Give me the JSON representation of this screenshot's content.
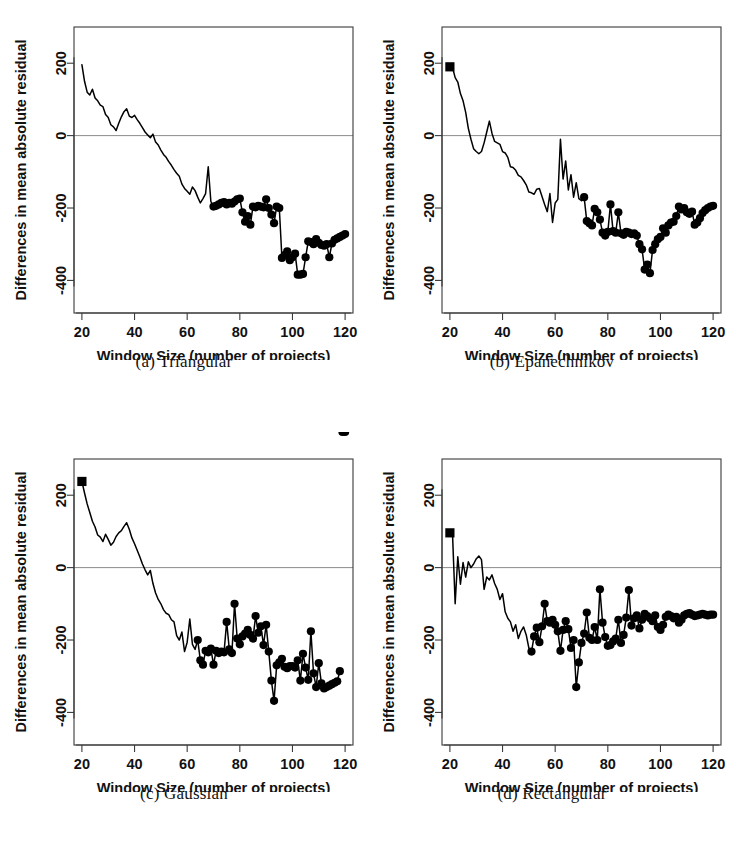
{
  "figure": {
    "type": "multi-panel-line-chart",
    "rows": 2,
    "columns": 2,
    "background": "#ffffff",
    "line_color": "#000000",
    "marker_color": "#000000",
    "zero_line_color": "#8d8d8d",
    "frame_color": "#3a3a3a"
  },
  "common": {
    "xlabel": "Window Size (number of projects)",
    "ylabel": "Differences in mean absolute residual",
    "xticks": [
      "20",
      "40",
      "60",
      "80",
      "100",
      "120"
    ],
    "yticks": [
      "200",
      "0",
      "-200",
      "-400"
    ],
    "xlim": [
      17,
      123
    ],
    "ylim": [
      -490,
      300
    ]
  },
  "chart_data": [
    {
      "id": "panel-a",
      "type": "line",
      "title": "",
      "caption": "(a) Triangular",
      "caption_tag": "(a)",
      "caption_name": "Triangular",
      "xlabel": "Window Size (number of projects)",
      "ylabel": "Differences in mean absolute residual",
      "xticks": [
        20,
        40,
        60,
        80,
        100,
        120
      ],
      "yticks": [
        200,
        0,
        -200,
        -400
      ],
      "xlim": [
        17,
        123
      ],
      "ylim": [
        -490,
        300
      ],
      "grid": false,
      "zero_line": 0,
      "legend": null,
      "start_marker": false,
      "x": [
        20,
        21,
        22,
        23,
        24,
        25,
        26,
        27,
        28,
        29,
        30,
        31,
        32,
        33,
        34,
        35,
        36,
        37,
        38,
        39,
        40,
        41,
        42,
        43,
        44,
        45,
        46,
        47,
        48,
        49,
        50,
        51,
        52,
        53,
        54,
        55,
        56,
        57,
        58,
        59,
        60,
        61,
        62,
        63,
        64,
        65,
        66,
        67,
        68,
        69,
        70,
        71,
        72,
        73,
        74,
        75,
        76,
        77,
        78,
        79,
        80,
        81,
        82,
        83,
        84,
        85,
        86,
        87,
        88,
        89,
        90,
        91,
        92,
        93,
        94,
        95,
        96,
        97,
        98,
        99,
        100,
        101,
        102,
        103,
        104,
        105,
        106,
        107,
        108,
        109,
        110,
        111,
        112,
        113,
        114,
        115,
        116,
        117,
        118,
        119,
        120
      ],
      "y": [
        196,
        150,
        120,
        112,
        128,
        104,
        96,
        84,
        80,
        58,
        50,
        30,
        24,
        14,
        34,
        52,
        66,
        74,
        54,
        50,
        56,
        44,
        34,
        22,
        10,
        2,
        -6,
        4,
        -18,
        -26,
        -40,
        -52,
        -60,
        -72,
        -82,
        -94,
        -104,
        -112,
        -134,
        -146,
        -154,
        -162,
        -142,
        -152,
        -170,
        -186,
        -174,
        -160,
        -86,
        -182,
        -196,
        -194,
        -190,
        -186,
        -184,
        -190,
        -186,
        -188,
        -182,
        -176,
        -174,
        -212,
        -238,
        -222,
        -246,
        -196,
        -198,
        -194,
        -196,
        -198,
        -176,
        -200,
        -218,
        -242,
        -196,
        -200,
        -338,
        -330,
        -320,
        -344,
        -336,
        -326,
        -384,
        -384,
        -382,
        -336,
        -292,
        -294,
        -300,
        -286,
        -296,
        -302,
        -304,
        -300,
        -336,
        -298,
        -288,
        -284,
        -280,
        -276,
        -272
      ],
      "marker_from_x": 70
    },
    {
      "id": "panel-b",
      "type": "line",
      "caption": "(b) Epanechnikov",
      "caption_tag": "(b)",
      "caption_name": "Epanechnikov",
      "xlabel": "Window Size (number of projects)",
      "ylabel": "Differences in mean absolute residual",
      "xticks": [
        20,
        40,
        60,
        80,
        100,
        120
      ],
      "yticks": [
        200,
        0,
        -200,
        -400
      ],
      "xlim": [
        17,
        123
      ],
      "ylim": [
        -490,
        300
      ],
      "grid": false,
      "zero_line": 0,
      "legend": null,
      "start_marker": true,
      "start_marker_shape": "square",
      "x": [
        20,
        21,
        22,
        23,
        24,
        25,
        26,
        27,
        28,
        29,
        30,
        31,
        32,
        33,
        34,
        35,
        36,
        37,
        38,
        39,
        40,
        41,
        42,
        43,
        44,
        45,
        46,
        47,
        48,
        49,
        50,
        51,
        52,
        53,
        54,
        55,
        56,
        57,
        58,
        59,
        60,
        61,
        62,
        63,
        64,
        65,
        66,
        67,
        68,
        69,
        70,
        71,
        72,
        73,
        74,
        75,
        76,
        77,
        78,
        79,
        80,
        81,
        82,
        83,
        84,
        85,
        86,
        87,
        88,
        89,
        90,
        91,
        92,
        93,
        94,
        95,
        96,
        97,
        98,
        99,
        100,
        101,
        102,
        103,
        104,
        105,
        106,
        107,
        108,
        109,
        110,
        111,
        112,
        113,
        114,
        115,
        116,
        117,
        118,
        119,
        120
      ],
      "y": [
        190,
        188,
        160,
        148,
        116,
        96,
        64,
        20,
        -10,
        -36,
        -44,
        -50,
        -44,
        -20,
        10,
        40,
        6,
        -16,
        -20,
        -24,
        -44,
        -48,
        -60,
        -86,
        -88,
        -96,
        -110,
        -114,
        -124,
        -136,
        -156,
        -158,
        -162,
        -148,
        -146,
        -168,
        -190,
        -210,
        -160,
        -240,
        -186,
        -176,
        -10,
        -120,
        -70,
        -150,
        -108,
        -170,
        -130,
        -174,
        -180,
        -170,
        -236,
        -242,
        -248,
        -202,
        -212,
        -232,
        -268,
        -276,
        -266,
        -190,
        -264,
        -268,
        -212,
        -270,
        -274,
        -266,
        -268,
        -272,
        -270,
        -276,
        -300,
        -314,
        -370,
        -356,
        -380,
        -316,
        -300,
        -286,
        -280,
        -256,
        -268,
        -248,
        -240,
        -238,
        -222,
        -196,
        -204,
        -200,
        -212,
        -216,
        -210,
        -246,
        -240,
        -228,
        -214,
        -206,
        -200,
        -196,
        -194,
        -200
      ],
      "marker_from_x": 71
    },
    {
      "id": "panel-c",
      "type": "line",
      "caption": "(c) Gaussian",
      "caption_tag": "(c)",
      "caption_name": "Gaussian",
      "xlabel": "Window Size (number of projects)",
      "ylabel": "Differences in mean absolute residual",
      "xticks": [
        20,
        40,
        60,
        80,
        100,
        120
      ],
      "yticks": [
        200,
        0,
        -200,
        -400
      ],
      "xlim": [
        17,
        123
      ],
      "ylim": [
        -490,
        300
      ],
      "grid": false,
      "zero_line": 0,
      "legend": null,
      "start_marker": true,
      "start_marker_shape": "square",
      "x": [
        20,
        21,
        22,
        23,
        24,
        25,
        26,
        27,
        28,
        29,
        30,
        31,
        32,
        33,
        34,
        35,
        36,
        37,
        38,
        39,
        40,
        41,
        42,
        43,
        44,
        45,
        46,
        47,
        48,
        49,
        50,
        51,
        52,
        53,
        54,
        55,
        56,
        57,
        58,
        59,
        60,
        61,
        62,
        63,
        64,
        65,
        66,
        67,
        68,
        69,
        70,
        71,
        72,
        73,
        74,
        75,
        76,
        77,
        78,
        79,
        80,
        81,
        82,
        83,
        84,
        85,
        86,
        87,
        88,
        89,
        90,
        91,
        92,
        93,
        94,
        95,
        96,
        97,
        98,
        99,
        100,
        101,
        102,
        103,
        104,
        105,
        106,
        107,
        108,
        109,
        110,
        111,
        112,
        113,
        114,
        115,
        116,
        117,
        118,
        119,
        120
      ],
      "y": [
        238,
        206,
        176,
        152,
        128,
        112,
        90,
        84,
        72,
        92,
        78,
        62,
        70,
        86,
        96,
        102,
        114,
        124,
        106,
        82,
        66,
        48,
        30,
        10,
        -6,
        -20,
        -8,
        -44,
        -70,
        -88,
        -100,
        -116,
        -126,
        -130,
        -144,
        -150,
        -188,
        -200,
        -178,
        -232,
        -206,
        -142,
        -212,
        -226,
        -200,
        -256,
        -268,
        -230,
        -234,
        -224,
        -268,
        -230,
        -236,
        -232,
        -234,
        -150,
        -226,
        -236,
        -100,
        -196,
        -212,
        -190,
        -182,
        -172,
        -186,
        -196,
        -134,
        -180,
        -162,
        -214,
        -158,
        -232,
        -312,
        -368,
        -270,
        -262,
        -252,
        -274,
        -278,
        -272,
        -272,
        -276,
        -256,
        -312,
        -238,
        -276,
        -310,
        -176,
        -292,
        -330,
        -264,
        -320,
        -334,
        -330,
        -326,
        -322,
        -318,
        -314,
        -286
      ],
      "marker_from_x": 64
    },
    {
      "id": "panel-d",
      "type": "line",
      "caption": "(d) Rectangular",
      "caption_tag": "(d)",
      "caption_name": "Rectangular",
      "xlabel": "Window Size (number of projects)",
      "ylabel": "Differences in mean absolute residual",
      "xticks": [
        20,
        40,
        60,
        80,
        100,
        120
      ],
      "yticks": [
        200,
        0,
        -200,
        -400
      ],
      "xlim": [
        17,
        123
      ],
      "ylim": [
        -490,
        300
      ],
      "grid": false,
      "zero_line": 0,
      "legend": null,
      "start_marker": true,
      "start_marker_shape": "square",
      "x": [
        20,
        21,
        22,
        23,
        24,
        25,
        26,
        27,
        28,
        29,
        30,
        31,
        32,
        33,
        34,
        35,
        36,
        37,
        38,
        39,
        40,
        41,
        42,
        43,
        44,
        45,
        46,
        47,
        48,
        49,
        50,
        51,
        52,
        53,
        54,
        55,
        56,
        57,
        58,
        59,
        60,
        61,
        62,
        63,
        64,
        65,
        66,
        67,
        68,
        69,
        70,
        71,
        72,
        73,
        74,
        75,
        76,
        77,
        78,
        79,
        80,
        81,
        82,
        83,
        84,
        85,
        86,
        87,
        88,
        89,
        90,
        91,
        92,
        93,
        94,
        95,
        96,
        97,
        98,
        99,
        100,
        101,
        102,
        103,
        104,
        105,
        106,
        107,
        108,
        109,
        110,
        111,
        112,
        113,
        114,
        115,
        116,
        117,
        118,
        119,
        120
      ],
      "y": [
        96,
        92,
        -100,
        30,
        -46,
        14,
        -26,
        16,
        0,
        10,
        24,
        32,
        22,
        -60,
        -26,
        -34,
        -20,
        -44,
        -60,
        -88,
        -72,
        -122,
        -140,
        -150,
        -176,
        -158,
        -196,
        -176,
        -164,
        -186,
        -222,
        -232,
        -190,
        -166,
        -206,
        -162,
        -100,
        -148,
        -152,
        -144,
        -158,
        -176,
        -230,
        -172,
        -148,
        -170,
        -222,
        -200,
        -330,
        -262,
        -208,
        -182,
        -124,
        -194,
        -200,
        -164,
        -200,
        -60,
        -152,
        -192,
        -216,
        -214,
        -204,
        -196,
        -144,
        -208,
        -186,
        -138,
        -62,
        -160,
        -140,
        -132,
        -168,
        -144,
        -128,
        -134,
        -140,
        -148,
        -132,
        -164,
        -172,
        -158,
        -136,
        -130,
        -134,
        -140,
        -136,
        -152,
        -144,
        -132,
        -128,
        -126,
        -130,
        -134,
        -132,
        -130,
        -128,
        -130,
        -132,
        -130,
        -130,
        -132
      ],
      "marker_from_x": 51
    }
  ]
}
